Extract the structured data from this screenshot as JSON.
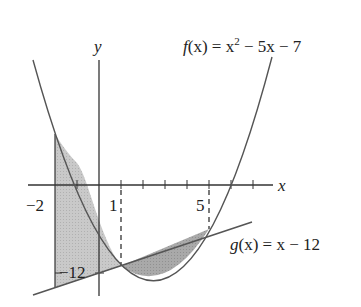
{
  "figure": {
    "axis_labels": {
      "x": "x",
      "y": "y"
    },
    "tick_labels": {
      "neg2": "−2",
      "one": "1",
      "five": "5",
      "neg12": "−12"
    },
    "functions": {
      "f": {
        "label_name": "f",
        "label_arg": "(x) = x",
        "label_exp": "2",
        "label_rest": " − 5x − 7",
        "expression": "x^2 - 5x - 7"
      },
      "g": {
        "label_name": "g",
        "label_rest": "(x) = x − 12",
        "expression": "x - 12"
      }
    },
    "intersections": [
      1,
      5
    ],
    "shaded_interval": [
      -2,
      5
    ],
    "colors": {
      "line": "#555555",
      "shade_light": "#c8c8c8",
      "shade_dark": "#a8a8a8"
    }
  }
}
